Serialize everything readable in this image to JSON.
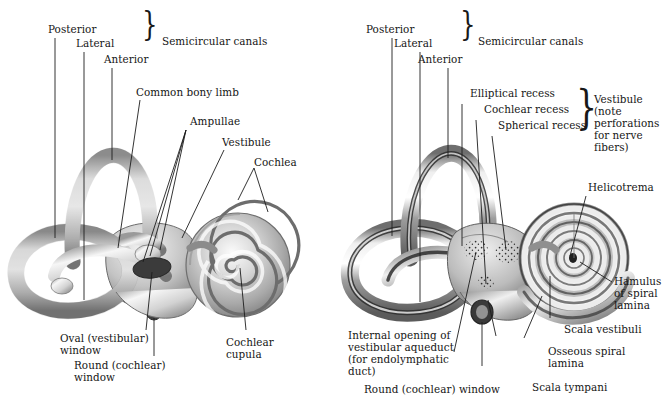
{
  "figure": {
    "background_color": "#ffffff",
    "ink_color": "#1a1a1a",
    "panels": 2
  },
  "left_panel": {
    "name": "bony-labyrinth-external-view",
    "braces": [
      {
        "id": "semicircular-canals-brace",
        "label": "Semicircular canals"
      }
    ],
    "labels": [
      {
        "id": "posterior",
        "text": "Posterior"
      },
      {
        "id": "lateral",
        "text": "Lateral"
      },
      {
        "id": "anterior",
        "text": "Anterior"
      },
      {
        "id": "semicircular-canals",
        "text": "Semicircular canals"
      },
      {
        "id": "common-bony-limb",
        "text": "Common bony limb"
      },
      {
        "id": "ampullae",
        "text": "Ampullae"
      },
      {
        "id": "vestibule",
        "text": "Vestibule"
      },
      {
        "id": "cochlea",
        "text": "Cochlea"
      },
      {
        "id": "oval-window-line1",
        "text": "Oval (vestibular)"
      },
      {
        "id": "oval-window-line2",
        "text": "window"
      },
      {
        "id": "round-window-line1",
        "text": "Round (cochlear)"
      },
      {
        "id": "round-window-line2",
        "text": "window"
      },
      {
        "id": "cochlear-cupula-line1",
        "text": "Cochlear"
      },
      {
        "id": "cochlear-cupula-line2",
        "text": "cupula"
      }
    ]
  },
  "right_panel": {
    "name": "bony-labyrinth-sectioned-view",
    "braces": [
      {
        "id": "semicircular-canals-brace",
        "label": "Semicircular canals"
      },
      {
        "id": "vestibule-brace",
        "label": "Vestibule"
      }
    ],
    "labels": [
      {
        "id": "posterior",
        "text": "Posterior"
      },
      {
        "id": "lateral",
        "text": "Lateral"
      },
      {
        "id": "anterior",
        "text": "Anterior"
      },
      {
        "id": "semicircular-canals",
        "text": "Semicircular canals"
      },
      {
        "id": "elliptical-recess",
        "text": "Elliptical recess"
      },
      {
        "id": "cochlear-recess",
        "text": "Cochlear recess"
      },
      {
        "id": "spherical-recess",
        "text": "Spherical recess"
      },
      {
        "id": "vestibule-line1",
        "text": "Vestibule"
      },
      {
        "id": "vestibule-line2",
        "text": "(note"
      },
      {
        "id": "vestibule-line3",
        "text": "perforations"
      },
      {
        "id": "vestibule-line4",
        "text": "for nerve"
      },
      {
        "id": "vestibule-line5",
        "text": "fibers)"
      },
      {
        "id": "helicotrema",
        "text": "Helicotrema"
      },
      {
        "id": "hamulus-line1",
        "text": "Hamulus"
      },
      {
        "id": "hamulus-line2",
        "text": "of spiral"
      },
      {
        "id": "hamulus-line3",
        "text": "lamina"
      },
      {
        "id": "scala-vestibuli",
        "text": "Scala vestibuli"
      },
      {
        "id": "osseous-spiral-lamina-line1",
        "text": "Osseous spiral"
      },
      {
        "id": "osseous-spiral-lamina-line2",
        "text": "lamina"
      },
      {
        "id": "scala-tympani",
        "text": "Scala tympani"
      },
      {
        "id": "internal-opening-line1",
        "text": "Internal opening of"
      },
      {
        "id": "internal-opening-line2",
        "text": "vestibular aqueduct"
      },
      {
        "id": "internal-opening-line3",
        "text": "(for endolymphatic"
      },
      {
        "id": "internal-opening-line4",
        "text": "duct)"
      },
      {
        "id": "round-window",
        "text": "Round (cochlear) window"
      }
    ]
  }
}
